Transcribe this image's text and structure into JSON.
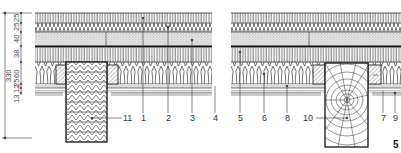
{
  "figure": {
    "number": "5",
    "type": "construction section drawing",
    "panels": [
      {
        "id": "left",
        "beam": "glued laminated timber (chevron hatch)",
        "labels": [
          "11",
          "1",
          "2",
          "3",
          "4"
        ]
      },
      {
        "id": "right",
        "beam": "solid round timber (growth rings)",
        "labels": [
          "5",
          "6",
          "8",
          "10",
          "7",
          "9"
        ]
      }
    ],
    "dimensions": {
      "overall": "330",
      "chain": [
        "13",
        "12",
        "25",
        "60",
        "38",
        "40",
        "25",
        "25"
      ]
    },
    "colors": {
      "line": "#222222",
      "stipple": "#d6d6d6",
      "background": "#ffffff"
    }
  },
  "labels": {
    "l11": "11",
    "l1": "1",
    "l2": "2",
    "l3": "3",
    "l4": "4",
    "l5": "5",
    "l6": "6",
    "l8": "8",
    "l10": "10",
    "l7": "7",
    "l9": "9"
  },
  "dims": {
    "overall": "330",
    "d13": "13",
    "d12": "12",
    "d25a": "25",
    "d60": "60",
    "d38": "38",
    "d40": "40",
    "d25b": "25",
    "d25c": "25"
  }
}
